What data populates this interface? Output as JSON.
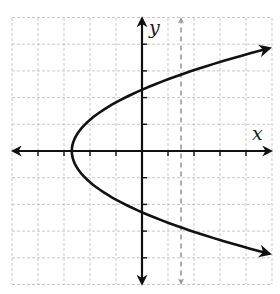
{
  "chart_data": {
    "type": "line",
    "title": "",
    "xlabel": "x",
    "ylabel": "y",
    "xlim": [
      -5,
      5
    ],
    "ylim": [
      -5,
      5
    ],
    "grid": true,
    "grid_style": "dashed light gray, 1 unit spacing",
    "axis_ticks": "unlabeled tick marks every 1 unit",
    "legend": null,
    "series": [
      {
        "name": "parabola",
        "kind": "sideways parabola opening right, x = a*y^2 + h",
        "approx_equation": "x = 0.51*y^2 - 2.7",
        "vertex": [
          -2.7,
          0
        ],
        "y_intercepts": [
          2.3,
          -2.3
        ],
        "arrow_ends": [
          [
            4.9,
            3.85
          ],
          [
            4.9,
            -3.85
          ]
        ],
        "style": "solid black, arrows at both ends"
      },
      {
        "name": "vertical dashed line",
        "kind": "vertical line",
        "x": 1.5,
        "style": "dashed gray, arrows at both ends"
      }
    ]
  },
  "labels": {
    "x_axis": "x",
    "y_axis": "y"
  },
  "layout": {
    "origin_px": [
      142,
      151
    ],
    "unit_px_x": 26,
    "unit_px_y": 26.7,
    "colors": {
      "curve": "#111111",
      "axes": "#111111",
      "grid": "#c8c8c8",
      "dashed": "#9a9a9a"
    }
  }
}
